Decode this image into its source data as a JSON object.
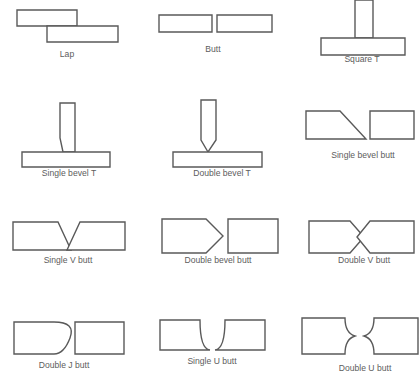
{
  "diagram": {
    "stroke_color": "#5a5a5a",
    "fill_color": "#ffffff",
    "caption_color": "#5d5d5d",
    "background": "#ffffff",
    "columns": 3,
    "rows": 4
  },
  "joints": [
    {
      "id": "lap",
      "label": "Lap",
      "row": 1,
      "col": 1,
      "label_x": 67,
      "label_y": 57,
      "pieces": [
        {
          "name": "upper-plate",
          "points": "17,10 77,10 77,26 17,26"
        },
        {
          "name": "lower-plate",
          "points": "47,26 118,26 118,42 47,42"
        }
      ]
    },
    {
      "id": "butt",
      "label": "Butt",
      "row": 1,
      "col": 2,
      "label_x": 213,
      "label_y": 52,
      "pieces": [
        {
          "name": "left-plate",
          "points": "159,15 212,15 212,32 159,32"
        },
        {
          "name": "right-plate",
          "points": "217,15 272,15 272,32 217,32"
        }
      ]
    },
    {
      "id": "square-t",
      "label": "Square T",
      "row": 1,
      "col": 3,
      "label_x": 362,
      "label_y": 62,
      "pieces": [
        {
          "name": "vertical-member",
          "points": "355,0 373,0 373,38 355,38"
        },
        {
          "name": "base-plate",
          "points": "321,38 405,38 405,55 321,55"
        }
      ]
    },
    {
      "id": "single-bevel-t",
      "label": "Single bevel T",
      "row": 2,
      "col": 1,
      "label_x": 69,
      "label_y": 176,
      "pieces": [
        {
          "name": "beveled-vertical-member",
          "points": "60,103 75,103 75,152 63,152 60,138"
        },
        {
          "name": "base-plate",
          "points": "22,152 110,152 110,167 22,167"
        }
      ]
    },
    {
      "id": "double-bevel-t",
      "label": "Double bevel T",
      "row": 2,
      "col": 2,
      "label_x": 222,
      "label_y": 176,
      "pieces": [
        {
          "name": "double-beveled-vertical-member",
          "points": "201,100 216,100 216,140 208,152 201,140"
        },
        {
          "name": "base-plate",
          "points": "173,152 262,152 262,167 173,167"
        }
      ]
    },
    {
      "id": "single-bevel-butt",
      "label": "Single bevel butt",
      "row": 2,
      "col": 3,
      "label_x": 363,
      "label_y": 158,
      "pieces": [
        {
          "name": "beveled-left-plate",
          "points": "306,111 340,111 366,139 306,139"
        },
        {
          "name": "square-right-plate",
          "points": "370,111 414,111 414,139 370,139"
        }
      ]
    },
    {
      "id": "single-v-butt",
      "label": "Single V butt",
      "row": 3,
      "col": 1,
      "label_x": 68,
      "label_y": 263,
      "pieces": [
        {
          "name": "left-v-plate",
          "points": "13,222 58,222 71,250 13,250"
        },
        {
          "name": "right-v-plate",
          "points": "80,222 125,222 125,250 67,250"
        }
      ]
    },
    {
      "id": "double-bevel-butt",
      "label": "Double bevel butt",
      "row": 3,
      "col": 2,
      "label_x": 218,
      "label_y": 263,
      "pieces": [
        {
          "name": "pointed-left-plate",
          "points": "162,219 206,219 223,236 206,253 162,253"
        },
        {
          "name": "square-right-plate",
          "points": "228,219 278,219 278,253 228,253"
        }
      ]
    },
    {
      "id": "double-v-butt",
      "label": "Double V butt",
      "row": 3,
      "col": 3,
      "label_x": 364,
      "label_y": 263,
      "pieces": [
        {
          "name": "pointed-left-plate",
          "points": "309,221 350,221 364,237 350,253 309,253"
        },
        {
          "name": "pointed-right-plate",
          "points": "370,221 414,221 414,253 370,253 357,237"
        }
      ]
    },
    {
      "id": "double-j-butt",
      "label": "Double J butt",
      "row": 4,
      "col": 1,
      "label_x": 64,
      "label_y": 368,
      "pieces": [
        {
          "name": "j-profile-left-plate",
          "path": "M14,322 L54,322 L54,322 Q76,322 70,338 Q64,354 54,354 L14,354 Z"
        },
        {
          "name": "square-right-plate",
          "points": "75,322 124,322 124,354 75,354"
        }
      ]
    },
    {
      "id": "single-u-butt",
      "label": "Single U butt",
      "row": 4,
      "col": 2,
      "label_x": 212,
      "label_y": 364,
      "pieces": [
        {
          "name": "u-profile-left-plate",
          "path": "M160,320 L200,320 Q200,349 210,350 L160,350 Z"
        },
        {
          "name": "u-profile-right-plate",
          "path": "M215,350 Q225,349 225,320 L265,320 L265,350 Z"
        }
      ]
    },
    {
      "id": "double-u-butt",
      "label": "Double U butt",
      "row": 4,
      "col": 3,
      "label_x": 365,
      "label_y": 371,
      "pieces": [
        {
          "name": "double-u-left-plate",
          "path": "M302,318 L345,318 Q345,333 355,336 Q345,339 345,354 L302,354 Z"
        },
        {
          "name": "double-u-right-plate",
          "path": "M364,336 Q374,333 374,318 L418,318 L418,354 L374,354 Q374,339 364,336 Z"
        }
      ]
    }
  ]
}
